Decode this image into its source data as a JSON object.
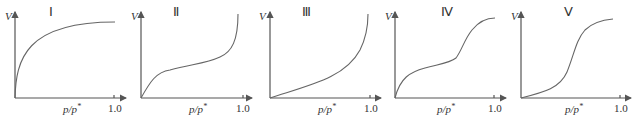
{
  "figure": {
    "y_axis_label": "V",
    "x_axis_label_base": "p/p",
    "x_axis_label_sup": "*",
    "x_tick_end": "1.0",
    "panels": [
      {
        "id": "I",
        "label": "Ⅰ",
        "shape": "Langmuir-type, rapid rise then plateau"
      },
      {
        "id": "II",
        "label": "Ⅱ",
        "shape": "S-shaped with knee, sharp rise near 1.0"
      },
      {
        "id": "III",
        "label": "Ⅲ",
        "shape": "convex, accelerating upward near 1.0"
      },
      {
        "id": "IV",
        "label": "Ⅳ",
        "shape": "knee, plateau, second rise then saturation plateau"
      },
      {
        "id": "V",
        "label": "Ⅴ",
        "shape": "slow start, sigmoidal rise then plateau"
      }
    ]
  }
}
